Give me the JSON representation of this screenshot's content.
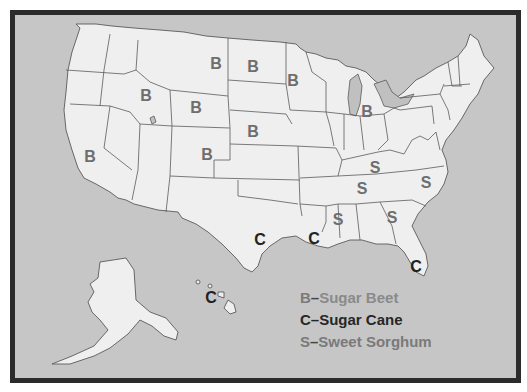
{
  "map": {
    "title": "U.S. sugar crop producing states",
    "colors": {
      "frame": "#2b2b2b",
      "water": "#c6c6c6",
      "land": "#efefef",
      "state_border": "#5a5a5a",
      "sugar_beet": "#6e6e6e",
      "sugar_cane": "#222222",
      "sweet_sorghum": "#6e6e6e"
    },
    "markers": [
      {
        "state": "Montana",
        "letter": "B",
        "x": 216,
        "y": 64
      },
      {
        "state": "North Dakota",
        "letter": "B",
        "x": 253,
        "y": 67
      },
      {
        "state": "Minnesota",
        "letter": "B",
        "x": 293,
        "y": 81
      },
      {
        "state": "Idaho",
        "letter": "B",
        "x": 146,
        "y": 96
      },
      {
        "state": "Wyoming",
        "letter": "B",
        "x": 196,
        "y": 108
      },
      {
        "state": "Michigan",
        "letter": "B",
        "x": 367,
        "y": 112
      },
      {
        "state": "Nebraska",
        "letter": "B",
        "x": 253,
        "y": 132
      },
      {
        "state": "California",
        "letter": "B",
        "x": 90,
        "y": 157
      },
      {
        "state": "Colorado",
        "letter": "B",
        "x": 207,
        "y": 155
      },
      {
        "state": "Kentucky",
        "letter": "S",
        "x": 375,
        "y": 168
      },
      {
        "state": "Tennessee",
        "letter": "S",
        "x": 362,
        "y": 189
      },
      {
        "state": "North Carolina",
        "letter": "S",
        "x": 426,
        "y": 183
      },
      {
        "state": "Mississippi",
        "letter": "S",
        "x": 338,
        "y": 220
      },
      {
        "state": "Georgia",
        "letter": "S",
        "x": 392,
        "y": 218
      },
      {
        "state": "Texas",
        "letter": "C",
        "x": 260,
        "y": 240
      },
      {
        "state": "Louisiana",
        "letter": "C",
        "x": 314,
        "y": 239
      },
      {
        "state": "Florida",
        "letter": "C",
        "x": 416,
        "y": 267
      },
      {
        "state": "Hawaii",
        "letter": "C",
        "x": 211,
        "y": 298
      }
    ]
  },
  "legend": {
    "items": [
      {
        "code": "B",
        "dash": "–",
        "label": "Sugar Beet"
      },
      {
        "code": "C",
        "dash": "–",
        "label": "Sugar Cane"
      },
      {
        "code": "S",
        "dash": "–",
        "label": "Sweet Sorghum"
      }
    ]
  }
}
